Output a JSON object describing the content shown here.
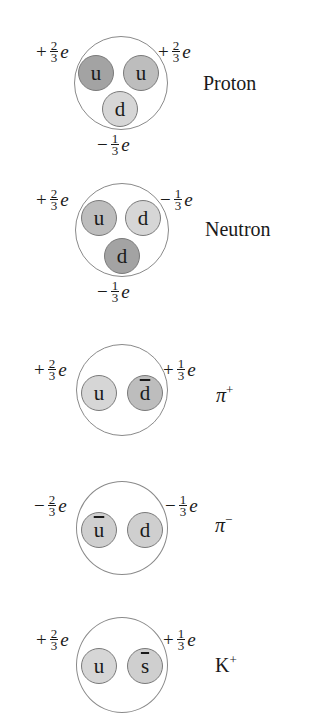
{
  "colors": {
    "dark_quark": "#a3a3a3",
    "medium_quark": "#bdbdbd",
    "light_quark": "#d6d6d6",
    "outline": "#8a8a8a"
  },
  "particles": [
    {
      "name": "Proton",
      "name_sup": "",
      "quarks": [
        {
          "label": "u",
          "anti": false,
          "shade": "#a3a3a3"
        },
        {
          "label": "u",
          "anti": false,
          "shade": "#bdbdbd"
        },
        {
          "label": "d",
          "anti": false,
          "shade": "#d6d6d6"
        }
      ],
      "charges": [
        {
          "sign": "+",
          "num": "2",
          "den": "3",
          "unit": "e"
        },
        {
          "sign": "+",
          "num": "2",
          "den": "3",
          "unit": "e"
        },
        {
          "sign": "−",
          "num": "1",
          "den": "3",
          "unit": "e"
        }
      ]
    },
    {
      "name": "Neutron",
      "name_sup": "",
      "quarks": [
        {
          "label": "u",
          "anti": false,
          "shade": "#bdbdbd"
        },
        {
          "label": "d",
          "anti": false,
          "shade": "#d6d6d6"
        },
        {
          "label": "d",
          "anti": false,
          "shade": "#a3a3a3"
        }
      ],
      "charges": [
        {
          "sign": "+",
          "num": "2",
          "den": "3",
          "unit": "e"
        },
        {
          "sign": "−",
          "num": "1",
          "den": "3",
          "unit": "e"
        },
        {
          "sign": "−",
          "num": "1",
          "den": "3",
          "unit": "e"
        }
      ]
    },
    {
      "name": "π",
      "name_sup": "+",
      "quarks": [
        {
          "label": "u",
          "anti": false,
          "shade": "#d6d6d6"
        },
        {
          "label": "d",
          "anti": true,
          "shade": "#bdbdbd"
        }
      ],
      "charges": [
        {
          "sign": "+",
          "num": "2",
          "den": "3",
          "unit": "e"
        },
        {
          "sign": "+",
          "num": "1",
          "den": "3",
          "unit": "e"
        }
      ]
    },
    {
      "name": "π",
      "name_sup": "−",
      "quarks": [
        {
          "label": "u",
          "anti": true,
          "shade": "#cfcfcf"
        },
        {
          "label": "d",
          "anti": false,
          "shade": "#cfcfcf"
        }
      ],
      "charges": [
        {
          "sign": "−",
          "num": "2",
          "den": "3",
          "unit": "e"
        },
        {
          "sign": "−",
          "num": "1",
          "den": "3",
          "unit": "e"
        }
      ]
    },
    {
      "name": "K",
      "name_sup": "+",
      "quarks": [
        {
          "label": "u",
          "anti": false,
          "shade": "#d6d6d6"
        },
        {
          "label": "s",
          "anti": true,
          "shade": "#cfcfcf"
        }
      ],
      "charges": [
        {
          "sign": "+",
          "num": "2",
          "den": "3",
          "unit": "e"
        },
        {
          "sign": "+",
          "num": "1",
          "den": "3",
          "unit": "e"
        }
      ]
    }
  ]
}
